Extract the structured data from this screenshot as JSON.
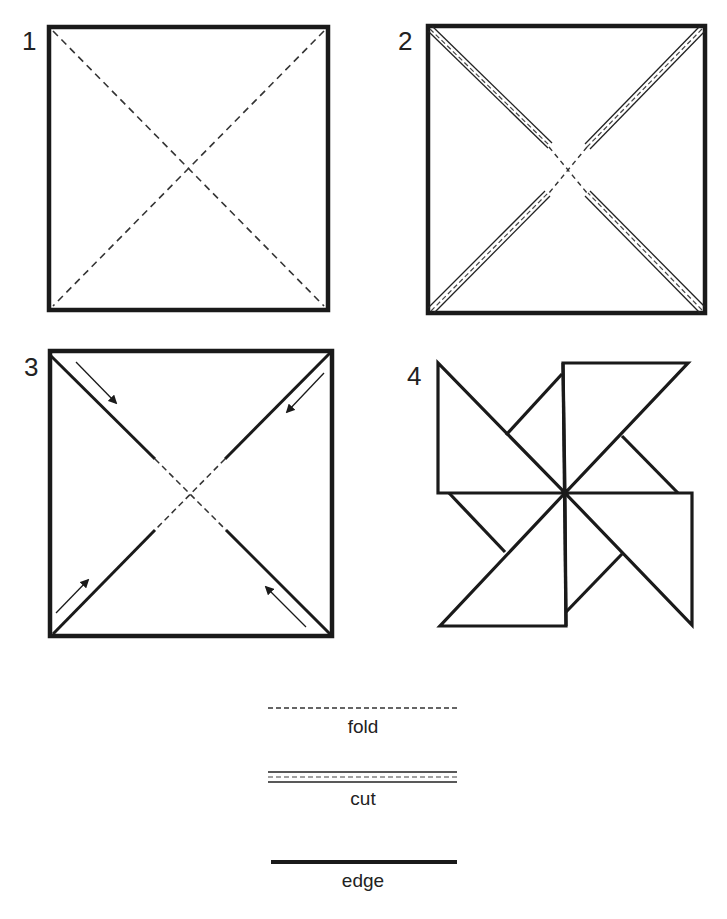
{
  "steps": [
    {
      "number": "1",
      "description": "square with dashed fold lines on both diagonals"
    },
    {
      "number": "2",
      "description": "square with cut lines along diagonals, stopping short of center"
    },
    {
      "number": "3",
      "description": "cut diagonals with arrows showing corners folding toward center"
    },
    {
      "number": "4",
      "description": "finished pinwheel"
    }
  ],
  "legend": {
    "fold": "fold",
    "cut": "cut",
    "edge": "edge"
  },
  "colors": {
    "line": "#1a1a1a",
    "background": "#ffffff"
  }
}
